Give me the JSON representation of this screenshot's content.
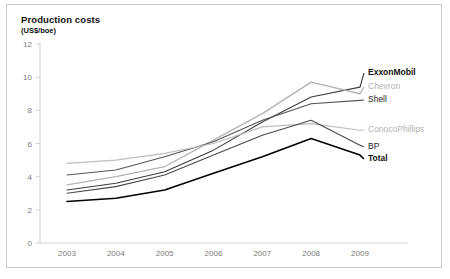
{
  "chart_data": {
    "type": "line",
    "title": "Production costs",
    "subtitle": "(US$/boe)",
    "xlabel": "",
    "ylabel": "",
    "ylim": [
      0,
      12
    ],
    "yticks": [
      0,
      2,
      4,
      6,
      8,
      10,
      12
    ],
    "grid": false,
    "legend_position": "right-inline",
    "x": [
      2003,
      2004,
      2005,
      2006,
      2007,
      2008,
      2009
    ],
    "categories": [
      "2003",
      "2004",
      "2005",
      "2006",
      "2007",
      "2008",
      "2009"
    ],
    "series": [
      {
        "name": "ExxonMobil",
        "color": "#3d3d3d",
        "label_style": "bold-dark",
        "values": [
          3.2,
          3.6,
          4.3,
          5.6,
          7.3,
          8.8,
          9.4
        ]
      },
      {
        "name": "Chevron",
        "color": "#b3b3b3",
        "label_style": "gray",
        "values": [
          3.5,
          4.0,
          4.6,
          6.2,
          7.8,
          9.7,
          9.0
        ]
      },
      {
        "name": "Shell",
        "color": "#555555",
        "label_style": "dark",
        "values": [
          4.1,
          4.4,
          5.2,
          6.1,
          7.4,
          8.4,
          8.6
        ]
      },
      {
        "name": "ConocoPhillips",
        "color": "#bdbdbd",
        "label_style": "gray",
        "values": [
          4.8,
          5.0,
          5.4,
          6.0,
          7.0,
          7.2,
          6.8
        ]
      },
      {
        "name": "BP",
        "color": "#4a4a4a",
        "label_style": "dark",
        "values": [
          3.0,
          3.4,
          4.1,
          5.3,
          6.5,
          7.4,
          5.9
        ]
      },
      {
        "name": "Total",
        "color": "#000000",
        "label_style": "bold-black",
        "values": [
          2.5,
          2.7,
          3.2,
          4.2,
          5.2,
          6.3,
          5.3
        ]
      }
    ],
    "axis_color": "#d2d2d2",
    "tick_label_color": "#7a7a7a"
  },
  "legend": {
    "items": [
      {
        "label": "ExxonMobil"
      },
      {
        "label": "Chevron"
      },
      {
        "label": "Shell"
      },
      {
        "label": "ConocoPhillips"
      },
      {
        "label": "BP"
      },
      {
        "label": "Total"
      }
    ]
  }
}
